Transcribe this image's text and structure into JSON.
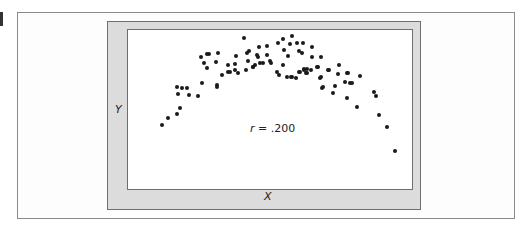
{
  "chart_data": {
    "type": "scatter",
    "title": "",
    "xlabel": "X",
    "ylabel": "Y",
    "annotation": {
      "variable": "r",
      "text": " = .200"
    },
    "grid": false,
    "legend": null,
    "note": "Curvilinear (inverted-U) relationship; points given in pixel coordinates of the original figure (x right, y down).",
    "points": [
      [
        162,
        125
      ],
      [
        168,
        118
      ],
      [
        177,
        114
      ],
      [
        180,
        108
      ],
      [
        177,
        87
      ],
      [
        182,
        88
      ],
      [
        187,
        88
      ],
      [
        178,
        94
      ],
      [
        189,
        95
      ],
      [
        198,
        96
      ],
      [
        202,
        83
      ],
      [
        201,
        57
      ],
      [
        207,
        54
      ],
      [
        209,
        54
      ],
      [
        218,
        53
      ],
      [
        204,
        63
      ],
      [
        207,
        68
      ],
      [
        216,
        62
      ],
      [
        244,
        38
      ],
      [
        236,
        56
      ],
      [
        247,
        53
      ],
      [
        249,
        51
      ],
      [
        248,
        61
      ],
      [
        253,
        67
      ],
      [
        228,
        65
      ],
      [
        235,
        64
      ],
      [
        222,
        75
      ],
      [
        228,
        72
      ],
      [
        230,
        72
      ],
      [
        235,
        70
      ],
      [
        238,
        73
      ],
      [
        246,
        70
      ],
      [
        217,
        85
      ],
      [
        217,
        87
      ],
      [
        259,
        47
      ],
      [
        267,
        46
      ],
      [
        257,
        55
      ],
      [
        258,
        57
      ],
      [
        267,
        55
      ],
      [
        253,
        67
      ],
      [
        255,
        65
      ],
      [
        260,
        63
      ],
      [
        263,
        63
      ],
      [
        270,
        61
      ],
      [
        271,
        63
      ],
      [
        278,
        43
      ],
      [
        283,
        39
      ],
      [
        292,
        36
      ],
      [
        290,
        44
      ],
      [
        297,
        43
      ],
      [
        303,
        43
      ],
      [
        284,
        50
      ],
      [
        288,
        56
      ],
      [
        299,
        51
      ],
      [
        302,
        53
      ],
      [
        283,
        65
      ],
      [
        277,
        72
      ],
      [
        279,
        75
      ],
      [
        287,
        77
      ],
      [
        292,
        77
      ],
      [
        299,
        72
      ],
      [
        304,
        70
      ],
      [
        307,
        73
      ],
      [
        312,
        47
      ],
      [
        312,
        57
      ],
      [
        321,
        57
      ],
      [
        307,
        69
      ],
      [
        311,
        70
      ],
      [
        318,
        67
      ],
      [
        329,
        70
      ],
      [
        339,
        65
      ],
      [
        338,
        74
      ],
      [
        348,
        73
      ],
      [
        360,
        76
      ],
      [
        321,
        77
      ],
      [
        345,
        82
      ],
      [
        350,
        83
      ],
      [
        320,
        78
      ],
      [
        322,
        88
      ],
      [
        323,
        87
      ],
      [
        333,
        93
      ],
      [
        335,
        86
      ],
      [
        352,
        83
      ],
      [
        347,
        98
      ],
      [
        300,
        72
      ],
      [
        304,
        69
      ],
      [
        306,
        73
      ],
      [
        317,
        67
      ],
      [
        328,
        70
      ],
      [
        347,
        73
      ],
      [
        291,
        77
      ],
      [
        296,
        78
      ],
      [
        357,
        107
      ],
      [
        374,
        92
      ],
      [
        376,
        96
      ],
      [
        379,
        115
      ],
      [
        387,
        127
      ],
      [
        395,
        151
      ]
    ]
  }
}
